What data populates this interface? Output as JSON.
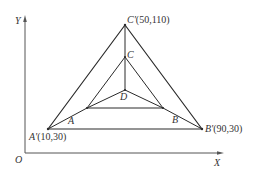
{
  "diagram": {
    "axes": {
      "x_label": "X",
      "y_label": "Y",
      "origin_label": "O"
    },
    "outer_triangle": {
      "A_prime": {
        "name": "A'",
        "coord": "(10,30)"
      },
      "B_prime": {
        "name": "B'",
        "coord": "(90,30)"
      },
      "C_prime": {
        "name": "C'",
        "coord": "(50,110)"
      }
    },
    "inner_triangle": {
      "A": {
        "name": "A"
      },
      "B": {
        "name": "B"
      },
      "C": {
        "name": "C"
      }
    },
    "center": {
      "name": "D"
    },
    "colors": {
      "line": "#2a2a2a",
      "axis": "#555555",
      "text": "#333333"
    }
  }
}
